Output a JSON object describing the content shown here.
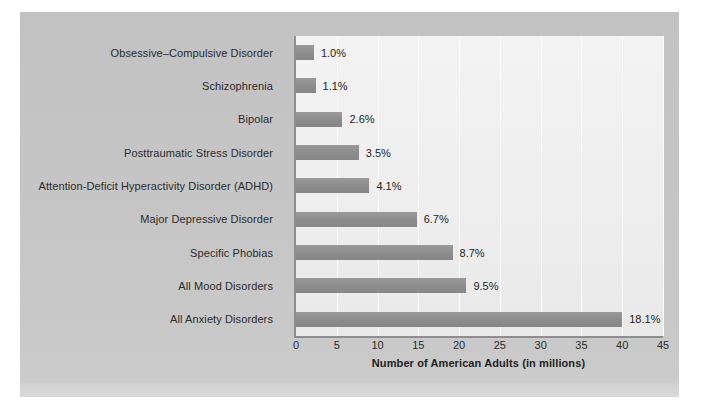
{
  "chart_data": {
    "type": "bar",
    "orientation": "horizontal",
    "title": "",
    "xlabel": "Number of American Adults (in millions)",
    "ylabel": "",
    "xlim": [
      0,
      45
    ],
    "xticks": [
      0,
      5,
      10,
      15,
      20,
      25,
      30,
      35,
      40,
      45
    ],
    "grid": "vertical",
    "legend": "none",
    "categories": [
      "Obsessive–Compulsive Disorder",
      "Schizophrenia",
      "Bipolar",
      "Posttraumatic Stress Disorder",
      "Attention-Deficit Hyperactivity Disorder (ADHD)",
      "Major Depressive Disorder",
      "Specific Phobias",
      "All Mood Disorders",
      "All Anxiety Disorders"
    ],
    "values": [
      2.2,
      2.4,
      5.7,
      7.7,
      9.0,
      14.8,
      19.2,
      20.9,
      40.0
    ],
    "data_labels": [
      "1.0%",
      "1.1%",
      "2.6%",
      "3.5%",
      "4.1%",
      "6.7%",
      "8.7%",
      "9.5%",
      "18.1%"
    ],
    "colors": {
      "bar": "#8d8d8d",
      "plot_background": "#eeeeee",
      "figure_background": "#c6c6c6",
      "gridline": "#fbfbfb",
      "axis": "#8e8e8e",
      "text": "#2b2b2b"
    }
  }
}
